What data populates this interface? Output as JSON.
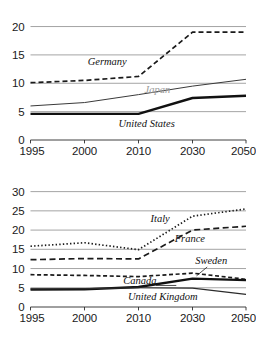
{
  "figure": {
    "name": "two-panel-line-chart",
    "background": "#ffffff",
    "grid_color": "#8d8d8d",
    "axis_color": "#2b2b2b"
  },
  "chart_data": [
    {
      "id": "top",
      "type": "line",
      "title": "",
      "subtitle": "",
      "xlabel": "",
      "ylabel": "",
      "grid": true,
      "legend": "inline-labels",
      "x": [
        1995,
        2000,
        2010,
        2030,
        2050
      ],
      "xtick_labels": [
        "1995",
        "2000",
        "2010",
        "2030",
        "2050"
      ],
      "ytick_labels": [
        "0",
        "5",
        "10",
        "15",
        "20"
      ],
      "yticks": [
        0,
        5,
        10,
        15,
        20
      ],
      "ylim": [
        0,
        20.8
      ],
      "xlim": [
        1995,
        2050
      ],
      "series": [
        {
          "name": "Germany",
          "label": "Germany",
          "style": "dashed",
          "color": "#1a1a1a",
          "width": 1.7,
          "dash": "5,3",
          "values": [
            10.1,
            10.5,
            11.2,
            19.0,
            19.0
          ],
          "label_x": 2004.2,
          "label_y": 13.2,
          "label_faded": false
        },
        {
          "name": "Japan",
          "label": "Japan",
          "style": "solid-thin",
          "color": "#3a3a3a",
          "width": 1.0,
          "dash": "none",
          "values": [
            6.0,
            6.6,
            8.0,
            9.5,
            10.7
          ],
          "label_x": 2017.0,
          "label_y": 8.2,
          "label_faded": true
        },
        {
          "name": "United States",
          "label": "United States",
          "style": "solid-thick",
          "color": "#111111",
          "width": 2.4,
          "dash": "none",
          "values": [
            4.6,
            4.6,
            4.6,
            7.4,
            7.8
          ],
          "label_x": 2013.0,
          "label_y": 2.3,
          "label_faded": false
        }
      ]
    },
    {
      "id": "bottom",
      "type": "line",
      "title": "",
      "subtitle": "",
      "xlabel": "",
      "ylabel": "",
      "grid": true,
      "legend": "inline-labels",
      "x": [
        1995,
        2000,
        2010,
        2030,
        2050
      ],
      "xtick_labels": [
        "1995",
        "2000",
        "2010",
        "2030",
        "2050"
      ],
      "ytick_labels": [
        "0",
        "5",
        "10",
        "15",
        "20",
        "25",
        "30"
      ],
      "yticks": [
        0,
        5,
        10,
        15,
        20,
        25,
        30
      ],
      "ylim": [
        0,
        31.2
      ],
      "xlim": [
        1995,
        2050
      ],
      "series": [
        {
          "name": "Italy",
          "label": "Italy",
          "style": "dotted",
          "color": "#1a1a1a",
          "width": 1.7,
          "dash": "1.4,2.2",
          "values": [
            15.8,
            16.7,
            14.9,
            23.6,
            25.5
          ],
          "label_x": 2018.0,
          "label_y": 22.2,
          "label_faded": false
        },
        {
          "name": "France",
          "label": "France",
          "style": "dashed-long",
          "color": "#1a1a1a",
          "width": 1.7,
          "dash": "6,3.5",
          "values": [
            12.3,
            12.6,
            12.5,
            20.0,
            21.0
          ],
          "label_x": 2029.0,
          "label_y": 16.8,
          "label_faded": false
        },
        {
          "name": "Sweden",
          "label": "Sweden",
          "style": "dashed-short",
          "color": "#1a1a1a",
          "width": 1.7,
          "dash": "4,2.6",
          "values": [
            8.4,
            8.2,
            7.9,
            8.8,
            7.2
          ],
          "label_x": 2037.0,
          "label_y": 11.3,
          "label_faded": false,
          "leader": {
            "x1": 2035.5,
            "y1": 10.4,
            "x2": 2031.5,
            "y2": 8.1
          }
        },
        {
          "name": "Canada",
          "label": "Canada",
          "style": "solid-thick",
          "color": "#111111",
          "width": 2.3,
          "dash": "none",
          "values": [
            4.5,
            4.6,
            5.2,
            7.4,
            7.0
          ],
          "label_x": 2010.5,
          "label_y": 5.9,
          "label_faded": false,
          "leader": {
            "x1": 2016.5,
            "y1": 5.6,
            "x2": 2024.0,
            "y2": 5.6
          }
        },
        {
          "name": "United Kingdom",
          "label": "United Kingdom",
          "style": "solid-thin",
          "color": "#2b2b2b",
          "width": 1.2,
          "dash": "none",
          "values": [
            4.7,
            4.8,
            5.0,
            4.9,
            3.3
          ],
          "label_x": 2019.0,
          "label_y": 1.9,
          "label_faded": false
        }
      ]
    }
  ]
}
